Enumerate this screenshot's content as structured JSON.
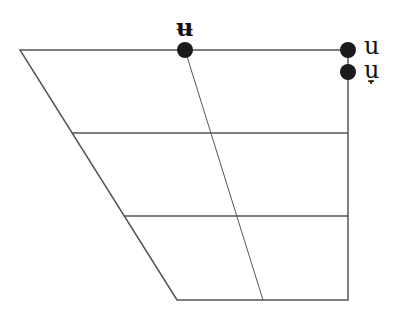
{
  "diagram": {
    "type": "ipa-vowel-chart",
    "line_color": "#555555",
    "dot_color": "#1a1a1a",
    "vowels": [
      {
        "symbol": "ʉ",
        "x": 185,
        "y": 50,
        "label_x": 176,
        "label_y": 18
      },
      {
        "symbol": "u",
        "x": 348,
        "y": 50,
        "label_x": 364,
        "label_y": 36
      },
      {
        "symbol": "u̞",
        "x": 348,
        "y": 72,
        "label_x": 364,
        "label_y": 62
      }
    ]
  }
}
